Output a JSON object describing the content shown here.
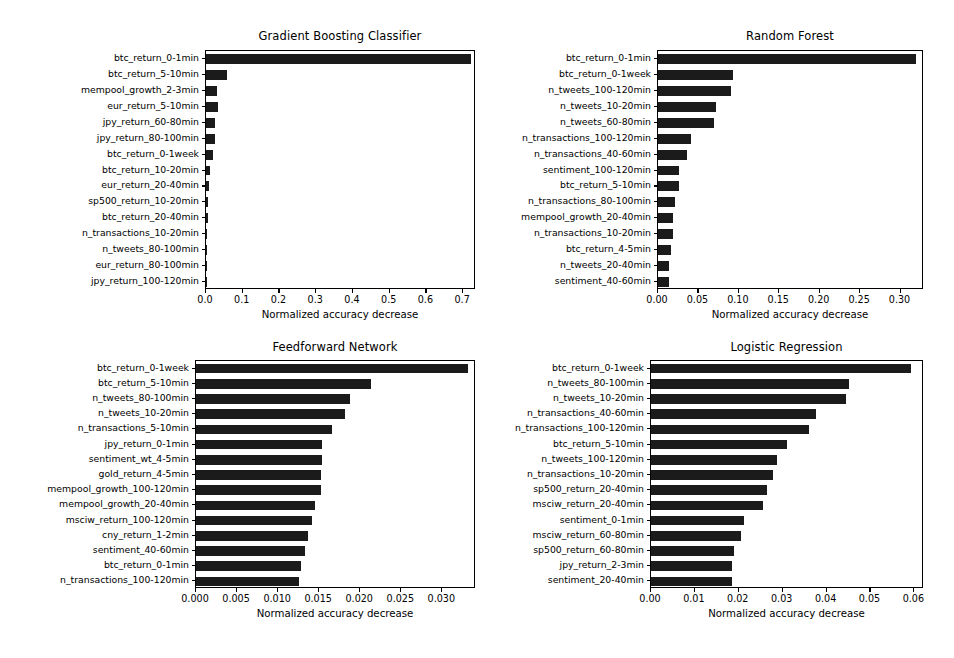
{
  "figure": {
    "width": 954,
    "height": 658,
    "background": "#ffffff",
    "bar_color": "#1b1b1b",
    "axis_color": "#000000",
    "xaxis_title": "Normalized accuracy decrease"
  },
  "chart_data": [
    {
      "type": "bar",
      "orientation": "horizontal",
      "title": "Gradient Boosting Classifier",
      "xlabel": "Normalized accuracy decrease",
      "ylabel": "",
      "grid": false,
      "legend": "none",
      "xlim": [
        0.0,
        0.735
      ],
      "xticks": [
        "0.0",
        "0.1",
        "0.2",
        "0.3",
        "0.4",
        "0.5",
        "0.6",
        "0.7"
      ],
      "xtick_values": [
        0.0,
        0.1,
        0.2,
        0.3,
        0.4,
        0.5,
        0.6,
        0.7
      ],
      "categories": [
        "btc_return_0-1min",
        "btc_return_5-10min",
        "mempool_growth_2-3min",
        "eur_return_5-10min",
        "jpy_return_60-80min",
        "jpy_return_80-100min",
        "btc_return_0-1week",
        "btc_return_10-20min",
        "eur_return_20-40min",
        "sp500_return_10-20min",
        "btc_return_20-40min",
        "n_transactions_10-20min",
        "n_tweets_80-100min",
        "eur_return_80-100min",
        "jpy_return_100-120min"
      ],
      "values": [
        0.722,
        0.056,
        0.031,
        0.034,
        0.024,
        0.024,
        0.018,
        0.012,
        0.0085,
        0.005,
        0.0045,
        0.004,
        0.0035,
        0.003,
        0.0025
      ]
    },
    {
      "type": "bar",
      "orientation": "horizontal",
      "title": "Random Forest",
      "xlabel": "Normalized accuracy decrease",
      "ylabel": "",
      "grid": false,
      "legend": "none",
      "xlim": [
        0.0,
        0.329
      ],
      "xticks": [
        "0.00",
        "0.05",
        "0.10",
        "0.15",
        "0.20",
        "0.25",
        "0.30"
      ],
      "xtick_values": [
        0.0,
        0.05,
        0.1,
        0.15,
        0.2,
        0.25,
        0.3
      ],
      "categories": [
        "btc_return_0-1min",
        "btc_return_0-1week",
        "n_tweets_100-120min",
        "n_tweets_10-20min",
        "n_tweets_60-80min",
        "n_transactions_100-120min",
        "n_transactions_40-60min",
        "sentiment_100-120min",
        "btc_return_5-10min",
        "n_transactions_80-100min",
        "mempool_growth_20-40min",
        "n_transactions_10-20min",
        "btc_return_4-5min",
        "n_tweets_20-40min",
        "sentiment_40-60min"
      ],
      "values": [
        0.3195,
        0.0925,
        0.0905,
        0.0715,
        0.0695,
        0.0405,
        0.036,
        0.0265,
        0.026,
        0.0205,
        0.019,
        0.0185,
        0.0155,
        0.0135,
        0.0135
      ]
    },
    {
      "type": "bar",
      "orientation": "horizontal",
      "title": "Feedforward Network",
      "xlabel": "Normalized accuracy decrease",
      "ylabel": "",
      "grid": false,
      "legend": "none",
      "xlim": [
        0.0,
        0.0341
      ],
      "xticks": [
        "0.000",
        "0.005",
        "0.010",
        "0.015",
        "0.020",
        "0.025",
        "0.030"
      ],
      "xtick_values": [
        0.0,
        0.005,
        0.01,
        0.015,
        0.02,
        0.025,
        0.03
      ],
      "categories": [
        "btc_return_0-1week",
        "btc_return_5-10min",
        "n_tweets_80-100min",
        "n_tweets_10-20min",
        "n_transactions_5-10min",
        "jpy_return_0-1min",
        "sentiment_wt_4-5min",
        "gold_return_4-5min",
        "mempool_growth_100-120min",
        "mempool_growth_20-40min",
        "msciw_return_100-120min",
        "cny_return_1-2min",
        "sentiment_40-60min",
        "btc_return_0-1min",
        "n_transactions_100-120min"
      ],
      "values": [
        0.0331,
        0.0213,
        0.0188,
        0.0181,
        0.0166,
        0.0154,
        0.0153,
        0.0152,
        0.0152,
        0.0145,
        0.0141,
        0.0137,
        0.0133,
        0.0128,
        0.0126
      ]
    },
    {
      "type": "bar",
      "orientation": "horizontal",
      "title": "Logistic Regression",
      "xlabel": "Normalized accuracy decrease",
      "ylabel": "",
      "grid": false,
      "legend": "none",
      "xlim": [
        0.0,
        0.0622
      ],
      "xticks": [
        "0.00",
        "0.01",
        "0.02",
        "0.03",
        "0.04",
        "0.05",
        "0.06"
      ],
      "xtick_values": [
        0.0,
        0.01,
        0.02,
        0.03,
        0.04,
        0.05,
        0.06
      ],
      "categories": [
        "btc_return_0-1week",
        "n_tweets_80-100min",
        "n_tweets_10-20min",
        "n_transactions_40-60min",
        "n_transactions_100-120min",
        "btc_return_5-10min",
        "n_tweets_100-120min",
        "n_transactions_10-20min",
        "sp500_return_20-40min",
        "msciw_return_20-40min",
        "sentiment_0-1min",
        "msciw_return_60-80min",
        "sp500_return_60-80min",
        "jpy_return_2-3min",
        "sentiment_20-40min"
      ],
      "values": [
        0.0593,
        0.0451,
        0.0445,
        0.0376,
        0.0359,
        0.0309,
        0.0288,
        0.0277,
        0.0264,
        0.0255,
        0.0212,
        0.0205,
        0.0188,
        0.0185,
        0.0184
      ]
    }
  ],
  "panels": [
    {
      "plot": {
        "x": 205,
        "y": 50,
        "w": 270,
        "h": 239
      },
      "title_y": 29
    },
    {
      "plot": {
        "x": 657,
        "y": 50,
        "w": 266,
        "h": 239
      },
      "title_y": 29
    },
    {
      "plot": {
        "x": 195,
        "y": 360,
        "w": 280,
        "h": 228
      },
      "title_y": 340
    },
    {
      "plot": {
        "x": 650,
        "y": 360,
        "w": 273,
        "h": 228
      },
      "title_y": 340
    }
  ]
}
